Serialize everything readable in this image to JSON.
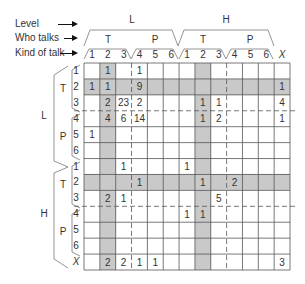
{
  "legend": {
    "level": "Level",
    "who_talks": "Who talks",
    "kind_of_talk": "Kind of talk"
  },
  "columns": {
    "levels": [
      "L",
      "H"
    ],
    "who": [
      "T",
      "P",
      "T",
      "P"
    ],
    "kinds": [
      "1",
      "2",
      "3",
      "4",
      "5",
      "6",
      "1",
      "2",
      "3",
      "4",
      "5",
      "6",
      "X"
    ]
  },
  "rows": {
    "levels": [
      "L",
      "H"
    ],
    "who": [
      "T",
      "P",
      "T",
      "P"
    ],
    "kinds": [
      "1",
      "2",
      "3",
      "4",
      "5",
      "6",
      "1",
      "2",
      "3",
      "4",
      "5",
      "6",
      "X"
    ]
  },
  "shading": {
    "columns": [
      1,
      7
    ],
    "rows": [
      1,
      7
    ],
    "color": "#c9c9c9"
  },
  "matrix": [
    [
      "",
      "1",
      "",
      "1",
      "",
      "",
      "",
      "",
      "",
      "",
      "",
      "",
      ""
    ],
    [
      "1",
      "1",
      "",
      "9",
      "",
      "",
      "",
      "",
      "",
      "",
      "",
      "",
      "1"
    ],
    [
      "",
      "2",
      "23",
      "2",
      "",
      "",
      "",
      "1",
      "1",
      "",
      "",
      "",
      "4"
    ],
    [
      "",
      "4",
      "6",
      "14",
      "",
      "",
      "",
      "1",
      "2",
      "",
      "",
      "",
      "1"
    ],
    [
      "1",
      "",
      "",
      "",
      "",
      "",
      "",
      "",
      "",
      "",
      "",
      "",
      ""
    ],
    [
      "",
      "",
      "",
      "",
      "",
      "",
      "",
      "",
      "",
      "",
      "",
      "",
      ""
    ],
    [
      "",
      "",
      "1",
      "",
      "",
      "",
      "1",
      "",
      "",
      "",
      "",
      "",
      ""
    ],
    [
      "",
      "",
      "",
      "1",
      "",
      "",
      "",
      "1",
      "",
      "2",
      "",
      "",
      ""
    ],
    [
      "",
      "2",
      "1",
      "",
      "",
      "",
      "",
      "",
      "5",
      "",
      "",
      "",
      ""
    ],
    [
      "",
      "",
      "",
      "",
      "",
      "",
      "1",
      "1",
      "",
      "",
      "",
      "",
      ""
    ],
    [
      "",
      "",
      "",
      "",
      "",
      "",
      "",
      "",
      "",
      "",
      "",
      "",
      ""
    ],
    [
      "",
      "",
      "",
      "",
      "",
      "",
      "",
      "",
      "",
      "",
      "",
      "",
      ""
    ],
    [
      "",
      "2",
      "2",
      "1",
      "1",
      "",
      "",
      "",
      "",
      "",
      "",
      "",
      "3"
    ]
  ]
}
